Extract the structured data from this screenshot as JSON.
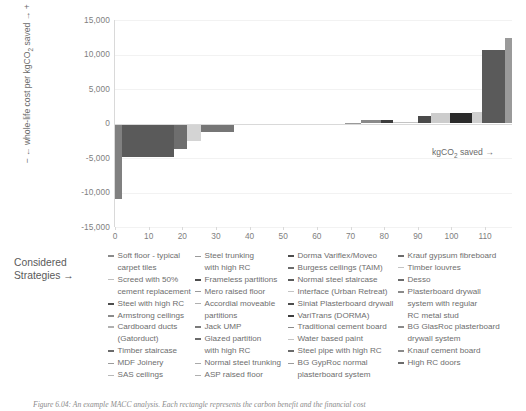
{
  "chart_data": {
    "type": "bar",
    "title": "",
    "xlabel": "kgCO2 saved →",
    "xlabel_text": "kgCO",
    "xlabel_sub": "2",
    "xlabel_tail": " saved →",
    "ylabel": "← whole-life cost per kgCO2 saved → +",
    "ylabel_text": "− ← whole-life cost per kgCO2 saved → +",
    "xlim": [
      0,
      118
    ],
    "ylim": [
      -15000,
      15000
    ],
    "grid": true,
    "legend_position": "below",
    "y_ticks": [
      "15,000",
      "10,000",
      "5,000",
      "0",
      "-5,000",
      "-10,000",
      "-15,000"
    ],
    "y_tick_values": [
      15000,
      10000,
      5000,
      0,
      -5000,
      -10000,
      -15000
    ],
    "x_ticks": [
      "0",
      "10",
      "20",
      "30",
      "40",
      "50",
      "60",
      "70",
      "80",
      "90",
      "100",
      "110"
    ],
    "x_tick_values": [
      0,
      10,
      20,
      30,
      40,
      50,
      60,
      70,
      80,
      90,
      100,
      110
    ],
    "note": "MACC waterfall: each rectangle width = kgCO2 saved, height = whole-life cost per kgCO2 saved",
    "bars": [
      {
        "x0": 0.0,
        "x1": 2.2,
        "value": -11000,
        "color": "#808080"
      },
      {
        "x0": 2.2,
        "x1": 17.5,
        "value": -4800,
        "color": "#5a5a5a"
      },
      {
        "x0": 17.5,
        "x1": 21.5,
        "value": -3750,
        "color": "#6e6e6e"
      },
      {
        "x0": 21.5,
        "x1": 25.5,
        "value": -2600,
        "color": "#d4d4d4"
      },
      {
        "x0": 25.5,
        "x1": 35.5,
        "value": -1300,
        "color": "#767676"
      },
      {
        "x0": 35.5,
        "x1": 43.0,
        "value": -250,
        "color": "#c9c9c9"
      },
      {
        "x0": 43.0,
        "x1": 55.0,
        "value": -130,
        "color": "#909090"
      },
      {
        "x0": 55.0,
        "x1": 68.5,
        "value": -90,
        "color": "#b5b5b5"
      },
      {
        "x0": 68.5,
        "x1": 73.0,
        "value": 110,
        "color": "#9a9a9a"
      },
      {
        "x0": 73.0,
        "x1": 79.0,
        "value": 560,
        "color": "#8a8a8a"
      },
      {
        "x0": 79.0,
        "x1": 82.5,
        "value": 560,
        "color": "#3d3d3d"
      },
      {
        "x0": 82.5,
        "x1": 90.0,
        "value": 160,
        "color": "#c4c4c4"
      },
      {
        "x0": 90.0,
        "x1": 94.0,
        "value": 1050,
        "color": "#4a4a4a"
      },
      {
        "x0": 94.0,
        "x1": 99.5,
        "value": 1500,
        "color": "#cccccc"
      },
      {
        "x0": 99.5,
        "x1": 106.0,
        "value": 1500,
        "color": "#2b2b2b"
      },
      {
        "x0": 106.0,
        "x1": 109.0,
        "value": 1700,
        "color": "#cfcfcf"
      },
      {
        "x0": 109.0,
        "x1": 116.0,
        "value": 10700,
        "color": "#5a5a5a"
      },
      {
        "x0": 116.0,
        "x1": 118.0,
        "value": 12400,
        "color": "#9a9a9a"
      }
    ]
  },
  "axis": {
    "y_title_prefix": "−",
    "y_title": "← whole-life cost per kgCO",
    "y_title_sub": "2",
    "y_title_suffix": " saved → +",
    "x_title": "kgCO",
    "x_title_sub": "2",
    "x_title_suffix": " saved →"
  },
  "legend": {
    "label": "Considered\nStrategies →",
    "columns": [
      {
        "items": [
          {
            "text": "Soft floor - typical\ncarpet tiles",
            "color": "#8a8a8a",
            "weight": "bold"
          },
          {
            "text": "Screed with 50%\ncement replacement",
            "color": "#c0c0c0",
            "weight": "thin"
          },
          {
            "text": "Steel with high RC",
            "color": "#4d4d4d",
            "weight": "bold"
          },
          {
            "text": "Armstrong ceilings",
            "color": "#8a8a8a",
            "weight": "bold"
          },
          {
            "text": "Cardboard ducts\n(Gatorduct)",
            "color": "#b0b0b0",
            "weight": "bold"
          },
          {
            "text": "Timber staircase",
            "color": "#6b6b6b",
            "weight": "bold"
          },
          {
            "text": "MDF Joinery",
            "color": "#9a9a9a",
            "weight": "thin"
          },
          {
            "text": "SAS ceilings",
            "color": "#b8b8b8",
            "weight": "thin"
          }
        ]
      },
      {
        "items": [
          {
            "text": "Steel trunking\nwith high RC",
            "color": "#9a9a9a",
            "weight": "thin"
          },
          {
            "text": "Frameless partitions",
            "color": "#4d4d4d",
            "weight": "bold"
          },
          {
            "text": "Mero raised floor",
            "color": "#9a9a9a",
            "weight": "thin"
          },
          {
            "text": "Accordial moveable\npartitions",
            "color": "#b0b0b0",
            "weight": "thin"
          },
          {
            "text": "Jack UMP",
            "color": "#7a7a7a",
            "weight": "bold"
          },
          {
            "text": "Glazed partition\nwith high RC",
            "color": "#6b6b6b",
            "weight": "bold"
          },
          {
            "text": "Normal steel trunking",
            "color": "#aaaaaa",
            "weight": "thin"
          },
          {
            "text": "ASP raised floor",
            "color": "#b0b0b0",
            "weight": "thin"
          }
        ]
      },
      {
        "items": [
          {
            "text": "Dorma Variflex/Moveo",
            "color": "#4d4d4d",
            "weight": "bold"
          },
          {
            "text": "Burgess ceilings (TAIM)",
            "color": "#6b6b6b",
            "weight": "bold"
          },
          {
            "text": "Normal steel staircase",
            "color": "#5a5a5a",
            "weight": "bold"
          },
          {
            "text": "Interface (Urban Retreat)",
            "color": "#c4c4c4",
            "weight": "thin"
          },
          {
            "text": "Siniat Plasterboard drywall",
            "color": "#4d4d4d",
            "weight": "bold"
          },
          {
            "text": "VariTrans (DORMA)",
            "color": "#3d3d3d",
            "weight": "bold"
          },
          {
            "text": "Traditional cement board",
            "color": "#8a8a8a",
            "weight": "thin"
          },
          {
            "text": "Water based paint",
            "color": "#c4c4c4",
            "weight": "thin"
          },
          {
            "text": "Steel pipe with high RC",
            "color": "#6b6b6b",
            "weight": "bold"
          },
          {
            "text": "BG GypRoc normal\nplasterboard system",
            "color": "#9a9a9a",
            "weight": "thin"
          }
        ]
      },
      {
        "items": [
          {
            "text": "Krauf gypsum fibreboard",
            "color": "#6b6b6b",
            "weight": "bold"
          },
          {
            "text": "Timber louvres",
            "color": "#c4c4c4",
            "weight": "thin"
          },
          {
            "text": "Desso",
            "color": "#6b6b6b",
            "weight": "bold"
          },
          {
            "text": "Plasterboard drywall\nsystem with regular\nRC metal stud",
            "color": "#8a8a8a",
            "weight": "bold"
          },
          {
            "text": "BG GlasRoc plasterboard\ndrywall system",
            "color": "#8a8a8a",
            "weight": "bold"
          },
          {
            "text": "Knauf cement board",
            "color": "#8a8a8a",
            "weight": "bold"
          },
          {
            "text": "High RC doors",
            "color": "#6b6b6b",
            "weight": "bold"
          }
        ]
      }
    ]
  },
  "caption": {
    "text": "Figure 6.04: An example MACC analysis. Each rectangle represents the carbon benefit and the financial cost"
  }
}
